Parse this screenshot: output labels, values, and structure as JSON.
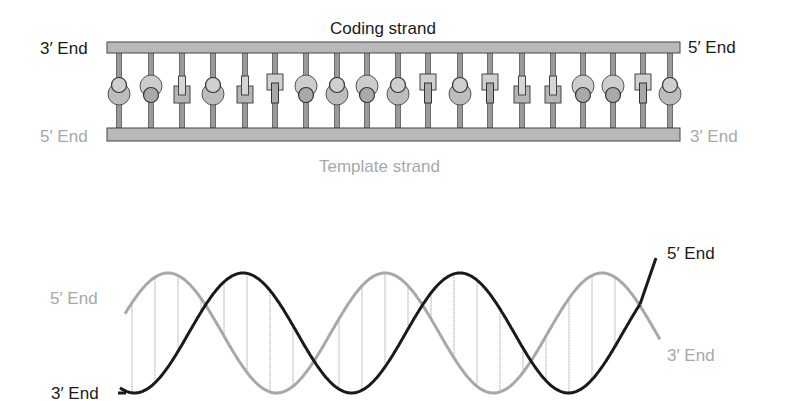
{
  "ladder": {
    "coding_strand_label": "Coding strand",
    "template_strand_label": "Template strand",
    "top_left_end": "3′ End",
    "top_right_end": "5′ End",
    "bottom_left_end": "5′ End",
    "bottom_right_end": "3′ End",
    "rung_x": [
      119,
      151,
      182,
      213,
      245,
      275,
      306,
      337,
      367,
      398,
      428,
      460,
      490,
      522,
      553,
      583,
      613,
      643,
      670
    ],
    "base_pairs": [
      "purine-bottom",
      "purine-top",
      "pyrimidine-bottom",
      "purine-bottom",
      "pyrimidine-bottom",
      "pyrimidine-top",
      "purine-top",
      "purine-bottom",
      "purine-top",
      "purine-bottom",
      "pyrimidine-top",
      "purine-bottom",
      "pyrimidine-top",
      "pyrimidine-bottom",
      "pyrimidine-bottom",
      "purine-top",
      "purine-top",
      "pyrimidine-top",
      "purine-bottom"
    ]
  },
  "helix": {
    "left_top_end": "5′ End",
    "left_bottom_end": "3′ End",
    "right_top_end": "5′ End",
    "right_bottom_end": "3′ End"
  },
  "colors": {
    "dark_strand": "#1a1a1a",
    "light_strand": "#a8a8a8",
    "backbone_fill": "#b9b9b9",
    "base_fill": "#bdbdbd"
  }
}
